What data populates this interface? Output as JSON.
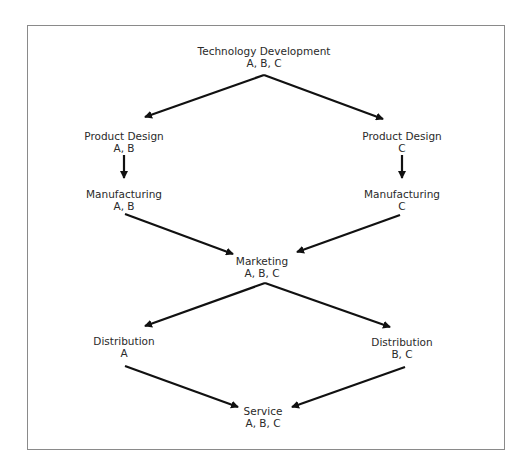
{
  "diagram": {
    "nodes": [
      {
        "id": "tech",
        "title": "Technology Development",
        "products": "A, B, C",
        "x": 266,
        "y": 43
      },
      {
        "id": "pd_ab",
        "title": "Product Design",
        "products": "A, B",
        "x": 124,
        "y": 128
      },
      {
        "id": "pd_c",
        "title": "Product Design",
        "products": "C",
        "x": 402,
        "y": 128
      },
      {
        "id": "mfg_ab",
        "title": "Manufacturing",
        "products": "A, B",
        "x": 124,
        "y": 187
      },
      {
        "id": "mfg_c",
        "title": "Manufacturing",
        "products": "C",
        "x": 402,
        "y": 187
      },
      {
        "id": "mkt",
        "title": "Marketing",
        "products": "A, B, C",
        "x": 263,
        "y": 256
      },
      {
        "id": "dist_a",
        "title": "Distribution",
        "products": "A",
        "x": 124,
        "y": 336
      },
      {
        "id": "dist_bc",
        "title": "Distribution",
        "products": "B, C",
        "x": 402,
        "y": 336
      },
      {
        "id": "svc",
        "title": "Service",
        "products": "A, B, C",
        "x": 263,
        "y": 406
      }
    ],
    "edges": [
      {
        "from": "tech",
        "to": "pd_ab"
      },
      {
        "from": "tech",
        "to": "pd_c"
      },
      {
        "from": "pd_ab",
        "to": "mfg_ab"
      },
      {
        "from": "pd_c",
        "to": "mfg_c"
      },
      {
        "from": "mfg_ab",
        "to": "mkt"
      },
      {
        "from": "mfg_c",
        "to": "mkt"
      },
      {
        "from": "mkt",
        "to": "dist_a"
      },
      {
        "from": "mkt",
        "to": "dist_bc"
      },
      {
        "from": "dist_a",
        "to": "svc"
      },
      {
        "from": "dist_bc",
        "to": "svc"
      }
    ],
    "colors": {
      "line": "#111111",
      "text": "#2a2a2a",
      "frame": "#8a8a8a"
    }
  }
}
